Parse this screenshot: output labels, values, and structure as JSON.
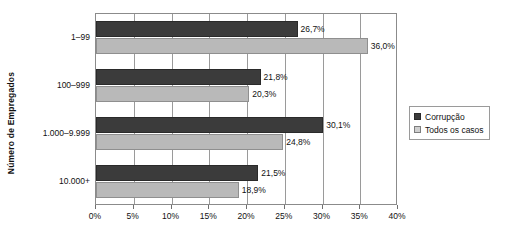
{
  "chart_data": {
    "type": "bar",
    "orientation": "horizontal",
    "title": "",
    "xlabel": "",
    "ylabel": "Número de Empregados",
    "categories": [
      "1–99",
      "100–999",
      "1.000–9.999",
      "10.000+"
    ],
    "series": [
      {
        "name": "Corrupção",
        "color": "#3b3b3b",
        "values": [
          26.7,
          21.8,
          30.1,
          21.5
        ],
        "labels": [
          "26,7%",
          "21,8%",
          "30,1%",
          "21,5%"
        ]
      },
      {
        "name": "Todos os casos",
        "color": "#b9b9b9",
        "values": [
          36.0,
          20.3,
          24.8,
          18.9
        ],
        "labels": [
          "36,0%",
          "20,3%",
          "24,8%",
          "18,9%"
        ]
      }
    ],
    "xlim": [
      0,
      40
    ],
    "xticks": [
      0,
      5,
      10,
      15,
      20,
      25,
      30,
      35,
      40
    ],
    "xtick_labels": [
      "0%",
      "5%",
      "10%",
      "15%",
      "20%",
      "25%",
      "30%",
      "35%",
      "40%"
    ],
    "grid": true,
    "legend_position": "right"
  },
  "legend": {
    "items": [
      {
        "label": "Corrupção",
        "swatch": "dark"
      },
      {
        "label": "Todos os casos",
        "swatch": "light"
      }
    ]
  }
}
